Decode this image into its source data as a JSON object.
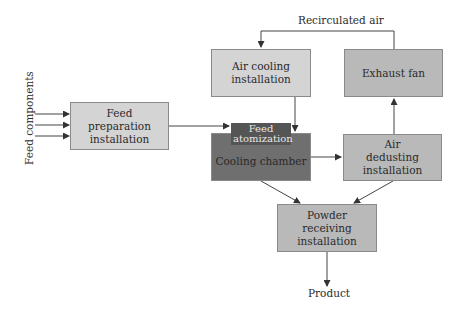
{
  "diagram": {
    "inputs_label": "Feed components",
    "nodes": {
      "feed_preparation": "Feed preparation installation",
      "air_cooling": "Air cooling installation",
      "exhaust_fan": "Exhaust fan",
      "feed_atomization": "Feed atomization",
      "cooling_chamber": "Cooling chamber",
      "air_dedusting": "Air dedusting installation",
      "powder_receiving": "Powder receiving installation"
    },
    "edge_labels": {
      "recirculated_air": "Recirculated air",
      "product": "Product"
    }
  }
}
